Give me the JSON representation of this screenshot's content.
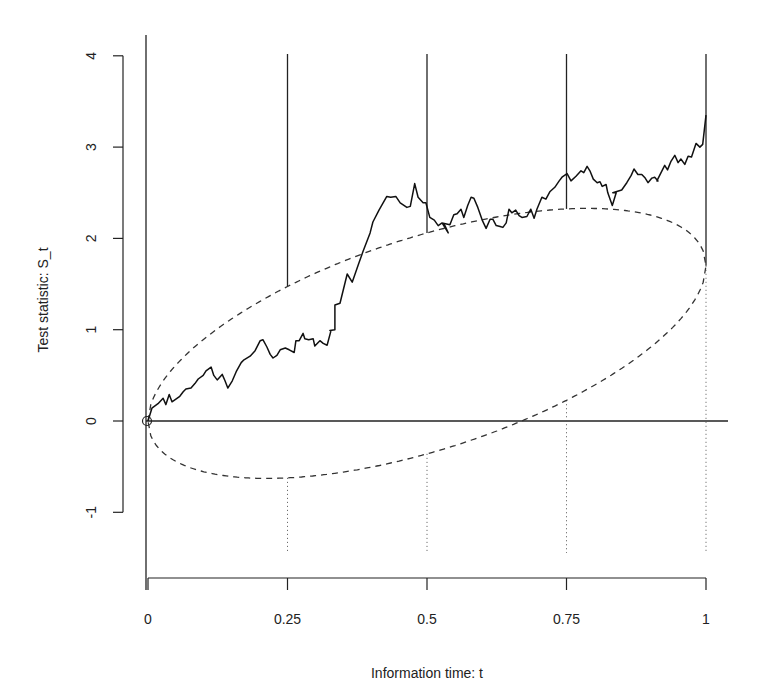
{
  "chart_data": {
    "type": "line",
    "title": "",
    "xlabel": "Information time: t",
    "ylabel": "Test statistic: S_t",
    "xlim": [
      0,
      1
    ],
    "ylim": [
      -1,
      4
    ],
    "x_ticks": [
      0,
      0.25,
      0.5,
      0.75,
      1
    ],
    "x_tick_labels": [
      "0",
      "0.25",
      "0.5",
      "0.75",
      "1"
    ],
    "y_ticks": [
      -1,
      0,
      1,
      2,
      3,
      4
    ],
    "y_tick_labels": [
      "-1",
      "0",
      "1",
      "2",
      "3",
      "4"
    ],
    "grid": false,
    "legend": null,
    "reference_line": {
      "y": 0,
      "style": "solid"
    },
    "interim_looks": [
      0.25,
      0.5,
      0.75,
      1
    ],
    "boundary_ellipse": {
      "style": "dashed",
      "center_slope": 1.7,
      "half_width_scale": 2.42,
      "upper": [
        [
          0.25,
          1.46
        ],
        [
          0.5,
          2.05
        ],
        [
          0.75,
          2.32
        ],
        [
          1,
          1.7
        ]
      ],
      "lower": [
        [
          0.25,
          -0.63
        ],
        [
          0.5,
          -0.37
        ],
        [
          0.75,
          0.23
        ],
        [
          1,
          1.7
        ]
      ]
    },
    "series": [
      {
        "name": "Brownian path S_t",
        "style": "solid",
        "points": [
          [
            0.0,
            0.0
          ],
          [
            0.007,
            0.14
          ],
          [
            0.018,
            0.19
          ],
          [
            0.027,
            0.25
          ],
          [
            0.032,
            0.18
          ],
          [
            0.038,
            0.29
          ],
          [
            0.043,
            0.21
          ],
          [
            0.05,
            0.24
          ],
          [
            0.057,
            0.27
          ],
          [
            0.063,
            0.32
          ],
          [
            0.068,
            0.35
          ],
          [
            0.077,
            0.36
          ],
          [
            0.084,
            0.41
          ],
          [
            0.09,
            0.46
          ],
          [
            0.099,
            0.5
          ],
          [
            0.104,
            0.55
          ],
          [
            0.113,
            0.59
          ],
          [
            0.118,
            0.5
          ],
          [
            0.124,
            0.45
          ],
          [
            0.133,
            0.51
          ],
          [
            0.138,
            0.44
          ],
          [
            0.143,
            0.36
          ],
          [
            0.151,
            0.44
          ],
          [
            0.158,
            0.54
          ],
          [
            0.167,
            0.64
          ],
          [
            0.172,
            0.67
          ],
          [
            0.183,
            0.71
          ],
          [
            0.192,
            0.77
          ],
          [
            0.201,
            0.88
          ],
          [
            0.206,
            0.89
          ],
          [
            0.213,
            0.81
          ],
          [
            0.219,
            0.73
          ],
          [
            0.224,
            0.69
          ],
          [
            0.231,
            0.72
          ],
          [
            0.237,
            0.78
          ],
          [
            0.246,
            0.8
          ],
          [
            0.253,
            0.78
          ],
          [
            0.262,
            0.75
          ],
          [
            0.265,
            0.88
          ],
          [
            0.271,
            0.88
          ],
          [
            0.278,
            0.96
          ],
          [
            0.281,
            0.9
          ],
          [
            0.288,
            0.89
          ],
          [
            0.296,
            0.9
          ],
          [
            0.299,
            0.82
          ],
          [
            0.308,
            0.88
          ],
          [
            0.314,
            0.85
          ],
          [
            0.321,
            0.83
          ],
          [
            0.328,
            0.99
          ],
          [
            0.326,
            0.99
          ],
          [
            0.335,
            1.0
          ],
          [
            0.335,
            1.27
          ],
          [
            0.344,
            1.29
          ],
          [
            0.357,
            1.61
          ],
          [
            0.366,
            1.52
          ],
          [
            0.378,
            1.73
          ],
          [
            0.385,
            1.85
          ],
          [
            0.398,
            2.06
          ],
          [
            0.403,
            2.18
          ],
          [
            0.414,
            2.31
          ],
          [
            0.428,
            2.46
          ],
          [
            0.435,
            2.45
          ],
          [
            0.444,
            2.46
          ],
          [
            0.452,
            2.39
          ],
          [
            0.464,
            2.34
          ],
          [
            0.47,
            2.35
          ],
          [
            0.478,
            2.6
          ],
          [
            0.484,
            2.45
          ],
          [
            0.493,
            2.39
          ],
          [
            0.498,
            2.39
          ],
          [
            0.505,
            2.23
          ],
          [
            0.513,
            2.2
          ],
          [
            0.52,
            2.14
          ],
          [
            0.527,
            2.17
          ],
          [
            0.532,
            2.14
          ],
          [
            0.538,
            2.06
          ],
          [
            0.527,
            2.17
          ],
          [
            0.541,
            2.15
          ],
          [
            0.548,
            2.26
          ],
          [
            0.554,
            2.27
          ],
          [
            0.561,
            2.32
          ],
          [
            0.566,
            2.23
          ],
          [
            0.573,
            2.36
          ],
          [
            0.579,
            2.45
          ],
          [
            0.584,
            2.44
          ],
          [
            0.591,
            2.34
          ],
          [
            0.599,
            2.2
          ],
          [
            0.606,
            2.11
          ],
          [
            0.613,
            2.21
          ],
          [
            0.618,
            2.21
          ],
          [
            0.624,
            2.14
          ],
          [
            0.631,
            2.13
          ],
          [
            0.636,
            2.12
          ],
          [
            0.642,
            2.17
          ],
          [
            0.647,
            2.32
          ],
          [
            0.652,
            2.28
          ],
          [
            0.659,
            2.31
          ],
          [
            0.665,
            2.25
          ],
          [
            0.67,
            2.23
          ],
          [
            0.679,
            2.24
          ],
          [
            0.686,
            2.32
          ],
          [
            0.692,
            2.22
          ],
          [
            0.697,
            2.32
          ],
          [
            0.706,
            2.45
          ],
          [
            0.713,
            2.43
          ],
          [
            0.72,
            2.51
          ],
          [
            0.72,
            2.51
          ],
          [
            0.729,
            2.56
          ],
          [
            0.737,
            2.63
          ],
          [
            0.742,
            2.67
          ],
          [
            0.751,
            2.71
          ],
          [
            0.758,
            2.63
          ],
          [
            0.767,
            2.68
          ],
          [
            0.776,
            2.74
          ],
          [
            0.781,
            2.72
          ],
          [
            0.787,
            2.79
          ],
          [
            0.792,
            2.74
          ],
          [
            0.798,
            2.65
          ],
          [
            0.805,
            2.61
          ],
          [
            0.81,
            2.62
          ],
          [
            0.814,
            2.57
          ],
          [
            0.821,
            2.59
          ],
          [
            0.824,
            2.5
          ],
          [
            0.832,
            2.36
          ],
          [
            0.839,
            2.5
          ],
          [
            0.833,
            2.5
          ],
          [
            0.849,
            2.53
          ],
          [
            0.858,
            2.61
          ],
          [
            0.866,
            2.69
          ],
          [
            0.871,
            2.76
          ],
          [
            0.878,
            2.7
          ],
          [
            0.885,
            2.7
          ],
          [
            0.891,
            2.66
          ],
          [
            0.896,
            2.61
          ],
          [
            0.903,
            2.66
          ],
          [
            0.908,
            2.67
          ],
          [
            0.914,
            2.63
          ],
          [
            0.912,
            2.63
          ],
          [
            0.926,
            2.8
          ],
          [
            0.931,
            2.75
          ],
          [
            0.937,
            2.84
          ],
          [
            0.944,
            2.91
          ],
          [
            0.95,
            2.83
          ],
          [
            0.955,
            2.87
          ],
          [
            0.962,
            2.81
          ],
          [
            0.968,
            2.9
          ],
          [
            0.974,
            2.89
          ],
          [
            0.982,
            3.04
          ],
          [
            0.989,
            3.0
          ],
          [
            0.994,
            3.03
          ],
          [
            1.0,
            3.35
          ]
        ]
      }
    ]
  }
}
